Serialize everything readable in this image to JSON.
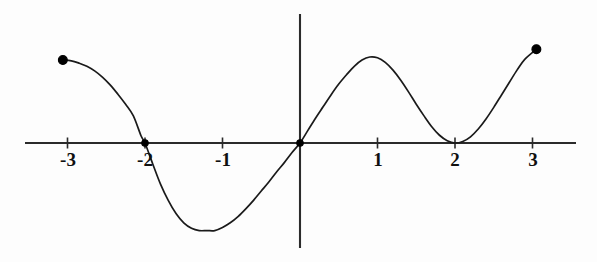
{
  "figure": {
    "background_color": "#fdfdfd",
    "curve_color": "#1a1a1a",
    "axis_color": "#2b2b2b",
    "point_color": "#000000",
    "width": 597,
    "height": 262
  },
  "axes": {
    "origin_px": {
      "x": 300,
      "y": 143
    },
    "unit_px": 77.5,
    "x_axis": {
      "x_start_px": 25,
      "x_end_px": 576,
      "y_px": 143
    },
    "y_axis": {
      "x_px": 300,
      "y_start_px": 14,
      "y_end_px": 248
    },
    "tick_length_px": 11,
    "label_offset_px": 6
  },
  "chart_data": {
    "type": "line",
    "title": "",
    "xlabel": "",
    "ylabel": "",
    "xlim": [
      -3.55,
      3.56
    ],
    "ylim": [
      -1.35,
      1.66
    ],
    "grid": false,
    "legend": null,
    "x_ticks": [
      -3,
      -2,
      -1,
      1,
      2,
      3
    ],
    "x_tick_labels": [
      "-3",
      "-2",
      "-1",
      "1",
      "2",
      "3"
    ],
    "y_ticks": [],
    "y_tick_labels": [],
    "roots": [
      -2,
      0,
      2
    ],
    "marked_points": [
      {
        "label": "left-endpoint",
        "x": -3.06,
        "y": 1.07,
        "filled": true
      },
      {
        "label": "root-at-minus-two",
        "x": -2.0,
        "y": 0.0,
        "filled": true
      },
      {
        "label": "origin-root",
        "x": 0.0,
        "y": 0.0,
        "filled": true
      },
      {
        "label": "right-endpoint",
        "x": 3.05,
        "y": 1.21,
        "filled": true
      }
    ],
    "local_extrema": [
      {
        "type": "local-minimum",
        "x": -1.1,
        "y": -1.13
      },
      {
        "type": "local-maximum",
        "x": 0.9,
        "y": 1.11
      },
      {
        "type": "local-minimum",
        "x": 2.0,
        "y": 0.0
      }
    ],
    "series": [
      {
        "name": "curve",
        "x": [
          -3.06,
          -2.95,
          -2.85,
          -2.75,
          -2.65,
          -2.55,
          -2.45,
          -2.35,
          -2.25,
          -2.15,
          -2.05,
          -2.0,
          -1.9,
          -1.8,
          -1.7,
          -1.6,
          -1.5,
          -1.4,
          -1.3,
          -1.2,
          -1.1,
          -1.0,
          -0.9,
          -0.8,
          -0.7,
          -0.6,
          -0.5,
          -0.4,
          -0.3,
          -0.2,
          -0.1,
          0.0,
          0.1,
          0.2,
          0.3,
          0.4,
          0.5,
          0.6,
          0.7,
          0.8,
          0.9,
          1.0,
          1.1,
          1.2,
          1.3,
          1.4,
          1.5,
          1.6,
          1.7,
          1.8,
          1.9,
          2.0,
          2.1,
          2.2,
          2.3,
          2.4,
          2.5,
          2.6,
          2.7,
          2.8,
          2.9,
          3.05
        ],
        "y": [
          1.07,
          1.06,
          1.03,
          0.99,
          0.93,
          0.85,
          0.75,
          0.63,
          0.5,
          0.35,
          0.09,
          0.0,
          -0.27,
          -0.53,
          -0.74,
          -0.91,
          -1.03,
          -1.1,
          -1.13,
          -1.13,
          -1.13,
          -1.09,
          -1.03,
          -0.95,
          -0.85,
          -0.74,
          -0.62,
          -0.5,
          -0.37,
          -0.25,
          -0.12,
          0.0,
          0.16,
          0.32,
          0.47,
          0.62,
          0.76,
          0.88,
          0.99,
          1.07,
          1.11,
          1.1,
          1.04,
          0.94,
          0.81,
          0.66,
          0.5,
          0.35,
          0.21,
          0.1,
          0.03,
          0.0,
          0.02,
          0.08,
          0.18,
          0.31,
          0.46,
          0.62,
          0.78,
          0.94,
          1.08,
          1.21
        ]
      }
    ]
  },
  "tick_labels": [
    {
      "text": "-3",
      "x_value": -3
    },
    {
      "text": "-2",
      "x_value": -2
    },
    {
      "text": "-1",
      "x_value": -1
    },
    {
      "text": "1",
      "x_value": 1
    },
    {
      "text": "2",
      "x_value": 2
    },
    {
      "text": "3",
      "x_value": 3
    }
  ]
}
